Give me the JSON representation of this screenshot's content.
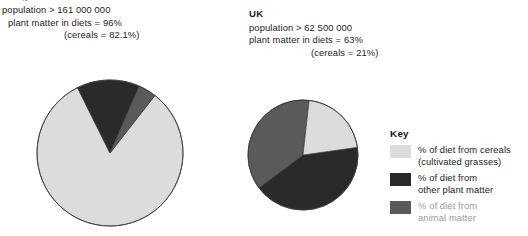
{
  "meta": {
    "colors": {
      "cereals": "#dcdcdc",
      "other_plant": "#2a2a2a",
      "animal": "#5a5a5a",
      "outline": "#3c3c3c",
      "background": "#ffffff"
    }
  },
  "partial_top_text": "a",
  "countries": [
    {
      "id": "country-a",
      "name": "",
      "population_line": "population > 161 000 000",
      "plant_matter_line": "plant matter in diets = 96%",
      "cereals_line": "(cereals = 82.1%)"
    },
    {
      "id": "country-b",
      "name": "UK",
      "population_line": "population > 62 500 000",
      "plant_matter_line": "plant matter in diets = 63%",
      "cereals_line": "(cereals = 21%)"
    }
  ],
  "key": {
    "title": "Key",
    "items": [
      {
        "swatch_color": "#dcdcdc",
        "line1": "% of diet from cereals",
        "line2": "(cultivated grasses)",
        "faded": false
      },
      {
        "swatch_color": "#2a2a2a",
        "line1": "% of diet from",
        "line2": "other plant matter",
        "faded": false
      },
      {
        "swatch_color": "#5a5a5a",
        "line1": "% of diet from",
        "line2": "animal matter",
        "faded": true
      }
    ]
  },
  "chart_data": [
    {
      "type": "pie",
      "title": "",
      "id": "country-a-pie",
      "center": [
        110,
        153
      ],
      "radius": 73,
      "start_angle_deg": -52,
      "labels": [
        "% of diet from cereals (cultivated grasses)",
        "% of diet from other plant matter",
        "% of diet from animal matter"
      ],
      "values": [
        82.1,
        13.9,
        4.0
      ],
      "colors": [
        "#dcdcdc",
        "#2a2a2a",
        "#5a5a5a"
      ],
      "units": "%",
      "legend_position": "right"
    },
    {
      "type": "pie",
      "title": "UK",
      "id": "country-b-pie",
      "center": [
        303,
        155
      ],
      "radius": 55,
      "start_angle_deg": -8,
      "labels": [
        "% of diet from other plant matter",
        "% of diet from animal matter",
        "% of diet from cereals (cultivated grasses)"
      ],
      "values": [
        42.0,
        37.0,
        21.0
      ],
      "colors": [
        "#2a2a2a",
        "#5a5a5a",
        "#dcdcdc"
      ],
      "units": "%",
      "legend_position": "right"
    }
  ]
}
